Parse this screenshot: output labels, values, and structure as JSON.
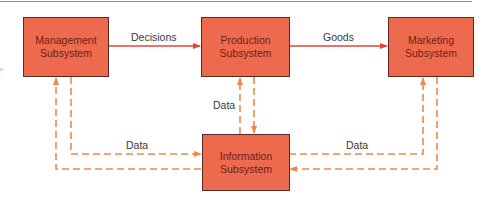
{
  "diagram": {
    "nodes": [
      {
        "id": "management",
        "line1": "Management",
        "line2": "Subsystem"
      },
      {
        "id": "production",
        "line1": "Production",
        "line2": "Subsystem"
      },
      {
        "id": "marketing",
        "line1": "Marketing",
        "line2": "Subsystem"
      },
      {
        "id": "information",
        "line1": "Information",
        "line2": "Subsystem"
      }
    ],
    "edges": [
      {
        "from": "management",
        "to": "production",
        "label": "Decisions",
        "style": "solid"
      },
      {
        "from": "production",
        "to": "marketing",
        "label": "Goods",
        "style": "solid"
      },
      {
        "from": "management",
        "to": "information",
        "label": "Data",
        "style": "dashed"
      },
      {
        "from": "information",
        "to": "management",
        "label": "",
        "style": "dashed"
      },
      {
        "from": "production",
        "to": "information",
        "label": "Data",
        "style": "dashed"
      },
      {
        "from": "information",
        "to": "production",
        "label": "",
        "style": "dashed"
      },
      {
        "from": "marketing",
        "to": "information",
        "label": "Data",
        "style": "dashed"
      },
      {
        "from": "information",
        "to": "marketing",
        "label": "",
        "style": "dashed"
      }
    ]
  },
  "colors": {
    "box_fill": "#ee6a4f",
    "box_border": "#5a2a20",
    "solid_arrow": "#e0473a",
    "dashed_arrow": "#f0884a",
    "label_text": "#3a3a3a"
  }
}
